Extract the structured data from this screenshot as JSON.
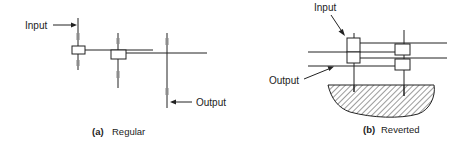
{
  "panels": [
    {
      "id": "a",
      "caption_tag": "(a)",
      "caption": "Regular",
      "labels": {
        "input": "Input",
        "output": "Output"
      }
    },
    {
      "id": "b",
      "caption_tag": "(b)",
      "caption": "Reverted",
      "labels": {
        "input": "Input",
        "output": "Output"
      }
    }
  ],
  "colors": {
    "line": "#222222",
    "gear_teeth": "#888888",
    "background": "#ffffff"
  }
}
